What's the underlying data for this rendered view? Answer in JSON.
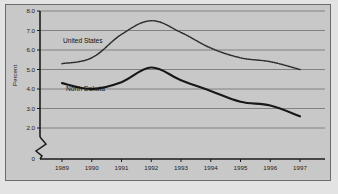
{
  "chart_data": {
    "type": "line",
    "title": "",
    "xlabel": "",
    "ylabel": "Percent",
    "categories": [
      "1989",
      "1990",
      "1991",
      "1992",
      "1993",
      "1994",
      "1995",
      "1996",
      "1997"
    ],
    "ylim": [
      0,
      8.0
    ],
    "y_axis_break": true,
    "y_break_between": [
      0,
      2.0
    ],
    "ytick_labels": [
      "8.0",
      "7.0",
      "6.0",
      "5.0",
      "4.0",
      "3.0",
      "2.0",
      "0"
    ],
    "ytick_values": [
      8.0,
      7.0,
      6.0,
      5.0,
      4.0,
      3.0,
      2.0,
      0
    ],
    "grid": "horizontal",
    "legend_position": "inline-annotations",
    "series": [
      {
        "name": "United States",
        "style": "dotted",
        "label": "United States",
        "values": [
          5.3,
          5.6,
          6.8,
          7.5,
          6.9,
          6.1,
          5.6,
          5.4,
          5.0
        ]
      },
      {
        "name": "North Dakota",
        "style": "solid",
        "label": "North Dakota",
        "values": [
          4.3,
          4.0,
          4.35,
          5.1,
          4.45,
          3.9,
          3.35,
          3.15,
          2.6
        ]
      }
    ]
  },
  "figure": {
    "y_axis_title": "Percent",
    "series_label_us": "United States",
    "series_label_nd": "North Dakota",
    "zero_label": "0"
  }
}
